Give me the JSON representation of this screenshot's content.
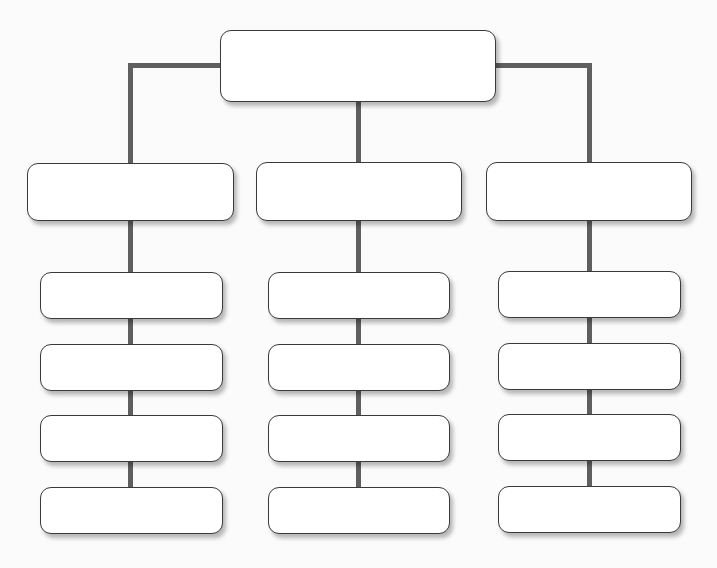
{
  "diagram": {
    "type": "org-chart",
    "colors": {
      "connector": "#5f5f5f",
      "box_border": "#3a3a3a",
      "box_fill": "#ffffff",
      "background": "#fbfbfb"
    },
    "root": {
      "label": ""
    },
    "columns": [
      {
        "header": {
          "label": ""
        },
        "items": [
          {
            "label": ""
          },
          {
            "label": ""
          },
          {
            "label": ""
          },
          {
            "label": ""
          }
        ]
      },
      {
        "header": {
          "label": ""
        },
        "items": [
          {
            "label": ""
          },
          {
            "label": ""
          },
          {
            "label": ""
          },
          {
            "label": ""
          }
        ]
      },
      {
        "header": {
          "label": ""
        },
        "items": [
          {
            "label": ""
          },
          {
            "label": ""
          },
          {
            "label": ""
          },
          {
            "label": ""
          }
        ]
      }
    ]
  }
}
